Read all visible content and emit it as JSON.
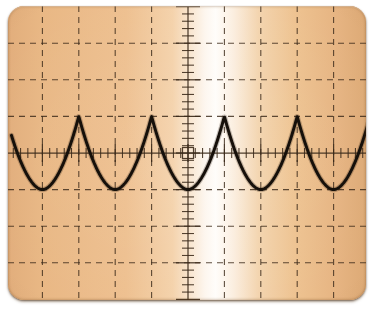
{
  "instrument": {
    "device_name": "oscilloscope-crt-display",
    "screen_label": "CRT graticule screen",
    "bezel_color": "#ffffff",
    "phosphor_color": "#ecbb89",
    "highlight_color": "#fffdfa",
    "graticule_color": "#3b2a1a",
    "trace_color": "#16100a"
  },
  "graticule": {
    "columns": 10,
    "rows": 8,
    "div_width_px": 36.4,
    "div_height_px": 36.6,
    "center_x_px": 180,
    "center_y_px": 147,
    "grid_style": "dashed",
    "center_marker": "center-square",
    "center_marker_size_px": 11,
    "minor_ticks_per_div": 5,
    "axis_style": "solid-with-ticks",
    "x_axis_label": "",
    "y_axis_label": ""
  },
  "chart_data": {
    "type": "line",
    "title": "",
    "subtitle": "",
    "xlabel": "",
    "ylabel": "",
    "waveform_name": "full-wave-rectified-cusp-wave",
    "units_x": "divisions",
    "units_y": "divisions",
    "xlim": [
      -5,
      5
    ],
    "ylim": [
      -4,
      4
    ],
    "grid": true,
    "legend": "none",
    "amplitude_div": 1,
    "period_div": 2,
    "peak_y_div": 1,
    "valley_y_div": -1,
    "peaks_x_div": [
      -3,
      -1,
      1,
      3
    ],
    "valleys_x_div": [
      -4,
      -2,
      0,
      2,
      4
    ],
    "series": [
      {
        "name": "channel-1",
        "x": [
          -4.85,
          -4.6,
          -4.3,
          -4.0,
          -3.7,
          -3.4,
          -3.0,
          -2.6,
          -2.3,
          -2.0,
          -1.7,
          -1.4,
          -1.0,
          -0.6,
          -0.3,
          0.0,
          0.3,
          0.6,
          1.0,
          1.4,
          1.7,
          2.0,
          2.3,
          2.6,
          3.0,
          3.4,
          3.7,
          4.0,
          4.3,
          4.6,
          4.95
        ],
        "y": [
          0.0,
          -0.42,
          -0.78,
          -1.0,
          -0.78,
          -0.42,
          1.0,
          -0.42,
          -0.78,
          -1.0,
          -0.78,
          -0.42,
          1.0,
          -0.42,
          -0.78,
          -1.0,
          -0.78,
          -0.42,
          1.0,
          -0.42,
          -0.78,
          -1.0,
          -0.78,
          -0.42,
          1.0,
          -0.42,
          -0.78,
          -1.0,
          -0.78,
          -0.42,
          0.62
        ]
      }
    ]
  }
}
